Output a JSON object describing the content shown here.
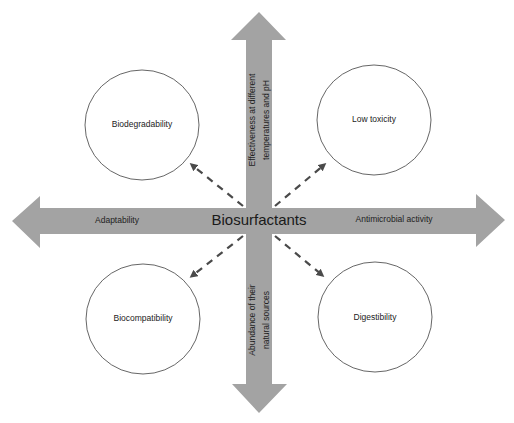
{
  "diagram": {
    "title": "Biosurfactants",
    "colors": {
      "arrow_fill": "#a3a3a3",
      "circle_stroke": "#555555",
      "dashed_arrow": "#4a4a4a",
      "text": "#222222",
      "background": "#ffffff"
    },
    "axes": {
      "up": {
        "line1": "Effectiveness at different",
        "line2": "temperatures and pH"
      },
      "down": {
        "line1": "Abundance of their",
        "line2": "natural sources"
      },
      "left": {
        "label": "Adaptability"
      },
      "right": {
        "label": "Antimicrobial activity"
      }
    },
    "circles": {
      "top_left": "Biodegradability",
      "top_right": "Low toxicity",
      "bottom_left": "Biocompatibility",
      "bottom_right": "Digestibility"
    }
  }
}
